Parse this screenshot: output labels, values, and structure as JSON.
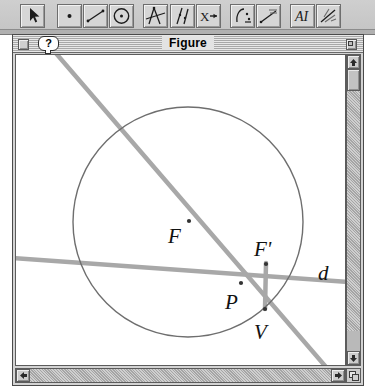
{
  "toolbar": {
    "name": "geometry-toolbar",
    "buttons": [
      {
        "id": "arrow",
        "label": "Selection Arrow",
        "icon": "arrow-cursor-icon",
        "x": 20,
        "selected": true
      },
      {
        "id": "point",
        "label": "Point",
        "icon": "point-icon",
        "x": 57,
        "selected": false
      },
      {
        "id": "segment",
        "label": "Segment",
        "icon": "segment-icon",
        "x": 83,
        "selected": false
      },
      {
        "id": "circle",
        "label": "Circle",
        "icon": "circle-icon",
        "x": 109,
        "selected": false
      },
      {
        "id": "construct",
        "label": "Construct",
        "icon": "compass-icon",
        "x": 143,
        "selected": false
      },
      {
        "id": "measure",
        "label": "Measure",
        "icon": "measure-icon",
        "x": 170,
        "selected": false
      },
      {
        "id": "calculate",
        "label": "Calculate",
        "icon": "x-calc-icon",
        "x": 196,
        "selected": false
      },
      {
        "id": "transform",
        "label": "Transform",
        "icon": "transform-icon",
        "x": 230,
        "selected": false
      },
      {
        "id": "animate",
        "label": "Animate",
        "icon": "animate-icon",
        "x": 256,
        "selected": false
      },
      {
        "id": "text",
        "label": "Text Tool",
        "icon": "text-A-icon",
        "x": 290,
        "selected": false
      },
      {
        "id": "custom",
        "label": "Custom Tool",
        "icon": "custom-tool-icon",
        "x": 316,
        "selected": false
      }
    ]
  },
  "window": {
    "title": "Figure",
    "close_label": "Close",
    "zoom_label": "Zoom",
    "help_label": "?"
  },
  "scrollbars": {
    "v_up_glyph": "▲",
    "v_down_glyph": "▼",
    "h_left_glyph": "◀",
    "h_right_glyph": "▶"
  },
  "chart_data": {
    "type": "diagram",
    "title": "Figure",
    "view": {
      "width": 329,
      "height": 310
    },
    "colors": {
      "circle": "#6e6e6e",
      "line": "#a8a8a8",
      "point": "#333333",
      "label": "#111111"
    },
    "circle": {
      "cx": 172,
      "cy": 167,
      "r": 115,
      "stroke_width": 1.4
    },
    "lines": [
      {
        "name": "secant-FV",
        "x1": 38,
        "y1": -4,
        "x2": 310,
        "y2": 312,
        "stroke_width": 4.5
      },
      {
        "name": "line-d",
        "x1": -4,
        "y1": 203,
        "x2": 333,
        "y2": 227,
        "stroke_width": 4.5
      },
      {
        "name": "segment-F-prime-V",
        "x1": 250,
        "y1": 208,
        "x2": 249,
        "y2": 254,
        "stroke_width": 4.5
      }
    ],
    "points": [
      {
        "name": "F",
        "label": "F",
        "x": 173,
        "y": 166,
        "label_x": 152,
        "label_y": 188
      },
      {
        "name": "Fp",
        "label": "F'",
        "x": 250,
        "y": 209,
        "label_x": 238,
        "label_y": 201
      },
      {
        "name": "P",
        "label": "P",
        "x": 225,
        "y": 228,
        "label_x": 209,
        "label_y": 254
      },
      {
        "name": "V",
        "label": "V",
        "x": 249,
        "y": 254,
        "label_x": 238,
        "label_y": 284
      }
    ],
    "free_labels": [
      {
        "name": "d",
        "label": "d",
        "x": 302,
        "y": 225
      }
    ]
  }
}
